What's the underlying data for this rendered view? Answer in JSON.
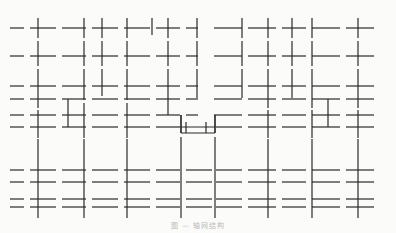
{
  "figure": {
    "type": "grid-line-diagram",
    "stroke_color": "#2a2a2a",
    "background": "#fbfbfa",
    "horizontal_rows_y": [
      28,
      56,
      86,
      99,
      115,
      127,
      170,
      182,
      199,
      207
    ],
    "horizontal_segments": [
      {
        "y": 28,
        "x": [
          [
            10,
            24
          ],
          [
            30,
            56
          ],
          [
            62,
            86
          ],
          [
            92,
            118
          ],
          [
            124,
            150
          ],
          [
            156,
            180
          ],
          [
            186,
            198
          ],
          [
            214,
            242
          ],
          [
            248,
            276
          ],
          [
            282,
            306
          ],
          [
            312,
            340
          ],
          [
            346,
            374
          ]
        ]
      },
      {
        "y": 56,
        "x": [
          [
            10,
            24
          ],
          [
            30,
            56
          ],
          [
            62,
            86
          ],
          [
            92,
            118
          ],
          [
            124,
            150
          ],
          [
            156,
            180
          ],
          [
            186,
            198
          ],
          [
            214,
            242
          ],
          [
            248,
            276
          ],
          [
            282,
            306
          ],
          [
            312,
            340
          ],
          [
            346,
            374
          ]
        ]
      },
      {
        "y": 86,
        "x": [
          [
            10,
            24
          ],
          [
            30,
            56
          ],
          [
            62,
            86
          ],
          [
            92,
            118
          ],
          [
            124,
            150
          ],
          [
            156,
            180
          ],
          [
            186,
            198
          ],
          [
            214,
            242
          ],
          [
            248,
            276
          ],
          [
            282,
            306
          ],
          [
            312,
            340
          ],
          [
            346,
            374
          ]
        ]
      },
      {
        "y": 99,
        "x": [
          [
            10,
            24
          ],
          [
            30,
            56
          ],
          [
            62,
            86
          ],
          [
            92,
            118
          ],
          [
            124,
            150
          ],
          [
            156,
            180
          ],
          [
            186,
            198
          ],
          [
            214,
            242
          ],
          [
            248,
            276
          ],
          [
            282,
            306
          ],
          [
            312,
            340
          ],
          [
            346,
            374
          ]
        ]
      },
      {
        "y": 115,
        "x": [
          [
            10,
            24
          ],
          [
            30,
            56
          ],
          [
            62,
            86
          ],
          [
            92,
            118
          ],
          [
            124,
            150
          ],
          [
            156,
            180
          ],
          [
            186,
            198
          ],
          [
            214,
            242
          ],
          [
            248,
            276
          ],
          [
            282,
            306
          ],
          [
            312,
            340
          ],
          [
            346,
            374
          ]
        ]
      },
      {
        "y": 127,
        "x": [
          [
            10,
            24
          ],
          [
            30,
            56
          ],
          [
            62,
            86
          ],
          [
            92,
            118
          ],
          [
            124,
            150
          ],
          [
            156,
            180
          ],
          [
            216,
            242
          ],
          [
            248,
            276
          ],
          [
            282,
            306
          ],
          [
            312,
            340
          ],
          [
            346,
            374
          ]
        ]
      },
      {
        "y": 170,
        "x": [
          [
            10,
            24
          ],
          [
            30,
            56
          ],
          [
            62,
            86
          ],
          [
            92,
            118
          ],
          [
            124,
            150
          ],
          [
            156,
            180
          ],
          [
            186,
            212
          ],
          [
            216,
            242
          ],
          [
            248,
            276
          ],
          [
            282,
            306
          ],
          [
            312,
            340
          ],
          [
            346,
            374
          ]
        ]
      },
      {
        "y": 182,
        "x": [
          [
            10,
            24
          ],
          [
            30,
            56
          ],
          [
            62,
            86
          ],
          [
            92,
            118
          ],
          [
            124,
            150
          ],
          [
            156,
            180
          ],
          [
            186,
            212
          ],
          [
            216,
            242
          ],
          [
            248,
            276
          ],
          [
            282,
            306
          ],
          [
            312,
            340
          ],
          [
            346,
            374
          ]
        ]
      },
      {
        "y": 199,
        "x": [
          [
            10,
            24
          ],
          [
            30,
            56
          ],
          [
            62,
            86
          ],
          [
            92,
            118
          ],
          [
            124,
            150
          ],
          [
            156,
            180
          ],
          [
            186,
            212
          ],
          [
            216,
            242
          ],
          [
            248,
            276
          ],
          [
            282,
            306
          ],
          [
            312,
            340
          ],
          [
            346,
            374
          ]
        ]
      },
      {
        "y": 207,
        "x": [
          [
            10,
            24
          ],
          [
            30,
            56
          ],
          [
            62,
            86
          ],
          [
            92,
            118
          ],
          [
            124,
            150
          ],
          [
            156,
            180
          ],
          [
            186,
            212
          ],
          [
            216,
            242
          ],
          [
            248,
            276
          ],
          [
            282,
            306
          ],
          [
            312,
            340
          ],
          [
            346,
            374
          ]
        ]
      }
    ],
    "vertical_segments": [
      {
        "x": 38,
        "y": [
          [
            18,
            38
          ],
          [
            41,
            66
          ],
          [
            69,
            108
          ],
          [
            110,
            138
          ],
          [
            139,
            218
          ]
        ]
      },
      {
        "x": 84,
        "y": [
          [
            18,
            38
          ],
          [
            41,
            66
          ],
          [
            69,
            100
          ],
          [
            103,
            138
          ],
          [
            139,
            218
          ]
        ]
      },
      {
        "x": 68,
        "y": [
          [
            99,
            127
          ]
        ]
      },
      {
        "x": 102,
        "y": [
          [
            18,
            38
          ],
          [
            41,
            66
          ],
          [
            69,
            96
          ]
        ]
      },
      {
        "x": 127,
        "y": [
          [
            18,
            38
          ],
          [
            41,
            66
          ],
          [
            69,
            100
          ],
          [
            103,
            138
          ],
          [
            139,
            218
          ]
        ]
      },
      {
        "x": 152,
        "y": [
          [
            18,
            35
          ]
        ]
      },
      {
        "x": 168,
        "y": [
          [
            18,
            38
          ],
          [
            41,
            66
          ],
          [
            69,
            115
          ]
        ]
      },
      {
        "x": 181,
        "y": [
          [
            115,
            133
          ],
          [
            137,
            218
          ]
        ]
      },
      {
        "x": 186,
        "y": [
          [
            122,
            133
          ]
        ]
      },
      {
        "x": 197,
        "y": [
          [
            18,
            38
          ],
          [
            41,
            66
          ],
          [
            69,
            98
          ]
        ]
      },
      {
        "x": 206,
        "y": [
          [
            122,
            133
          ]
        ]
      },
      {
        "x": 215,
        "y": [
          [
            115,
            133
          ],
          [
            137,
            218
          ]
        ]
      },
      {
        "x": 242,
        "y": [
          [
            18,
            38
          ],
          [
            41,
            66
          ],
          [
            69,
            98
          ]
        ]
      },
      {
        "x": 268,
        "y": [
          [
            18,
            38
          ],
          [
            41,
            66
          ],
          [
            69,
            108
          ],
          [
            110,
            138
          ],
          [
            139,
            218
          ]
        ]
      },
      {
        "x": 292,
        "y": [
          [
            18,
            38
          ],
          [
            41,
            66
          ],
          [
            69,
            98
          ]
        ]
      },
      {
        "x": 312,
        "y": [
          [
            18,
            38
          ],
          [
            41,
            66
          ],
          [
            69,
            108
          ],
          [
            110,
            138
          ],
          [
            139,
            218
          ]
        ]
      },
      {
        "x": 328,
        "y": [
          [
            99,
            127
          ]
        ]
      },
      {
        "x": 358,
        "y": [
          [
            18,
            38
          ],
          [
            41,
            66
          ],
          [
            69,
            108
          ],
          [
            110,
            138
          ],
          [
            139,
            218
          ]
        ]
      }
    ],
    "step_outline": {
      "points": [
        [
          181,
          115
        ],
        [
          181,
          133
        ],
        [
          215,
          133
        ],
        [
          215,
          115
        ]
      ],
      "inner_bar_y": 127
    }
  },
  "caption": {
    "text": "图 — 轴网结构"
  }
}
